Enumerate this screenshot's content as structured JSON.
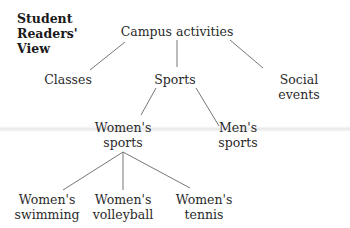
{
  "title": "Student\nReaders'\nView",
  "tree": {
    "root": "Campus activities",
    "level1": [
      "Classes",
      "Sports",
      "Social events"
    ],
    "level2": [
      "Women's\nsports",
      "Men's\nsports"
    ],
    "level3": [
      "Women's\nswimming",
      "Women's\nvolleyball",
      "Women's\ntennis"
    ]
  },
  "colors": {
    "text": "#2a2a2a",
    "line": "#555555",
    "background": "#ffffff"
  }
}
